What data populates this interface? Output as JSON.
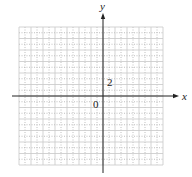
{
  "diagram": {
    "type": "coordinate-grid",
    "axes": {
      "x_label": "x",
      "y_label": "y"
    },
    "grid": {
      "x_range": [
        -14,
        10
      ],
      "y_range": [
        -12,
        12
      ],
      "major_step": 2,
      "minor_step": 1,
      "major_style": "solid",
      "minor_style": "dotted"
    },
    "annotations": {
      "origin_label": "0",
      "tick_label": "2",
      "tick_label_value_on_y": 2
    },
    "colors": {
      "grid": "#c8c8c8",
      "minor": "#b0b0b0",
      "axis": "#222222",
      "text": "#222222"
    }
  }
}
